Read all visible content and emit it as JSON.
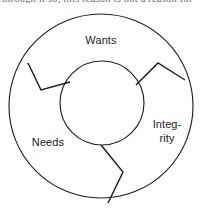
{
  "page": {
    "cut_text_above": "through it so, this reason is not a reason for"
  },
  "diagram": {
    "type": "segmented-ring",
    "title": "",
    "colors": {
      "stroke": "#1f1f1f",
      "background": "#ffffff",
      "label": "#1a1a1a"
    },
    "outer_circle": {
      "cx": 101,
      "cy": 106,
      "r": 92
    },
    "inner_circle": {
      "cx": 102,
      "cy": 103,
      "r": 42
    },
    "segments": [
      {
        "id": "wants",
        "label": "Wants",
        "label_lines": [
          "Wants"
        ],
        "label_x": 101,
        "label_y": 44
      },
      {
        "id": "needs",
        "label": "Needs",
        "label_lines": [
          "Needs"
        ],
        "label_x": 48,
        "label_y": 146
      },
      {
        "id": "integrity",
        "label": "Integrity",
        "label_lines": [
          "Integ-",
          "rity"
        ],
        "label_x": 167,
        "label_y": 134
      }
    ],
    "dividers": [
      {
        "id": "divider-wants-needs",
        "points": "28,63 41,90 70,82"
      },
      {
        "id": "divider-wants-integrity",
        "points": "136,85 158,63 185,80"
      },
      {
        "id": "divider-needs-integrity",
        "points": "101,145 123,172 108,203"
      }
    ]
  }
}
